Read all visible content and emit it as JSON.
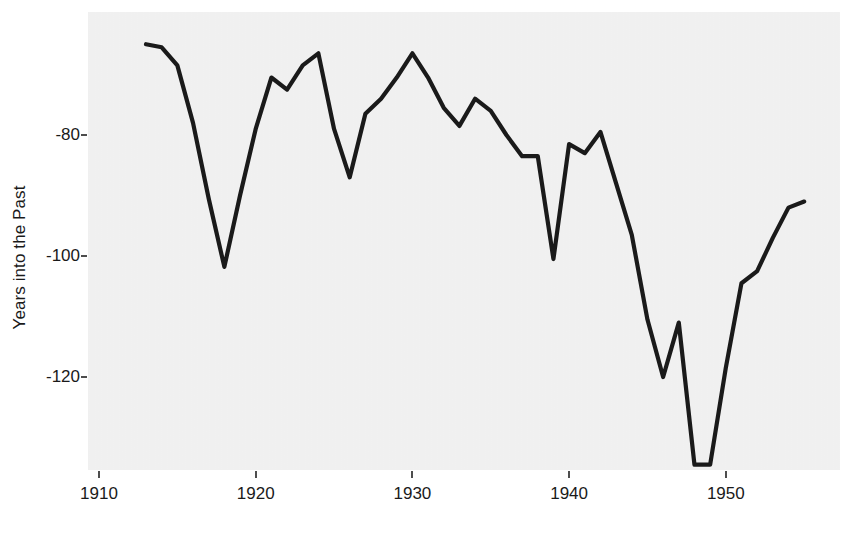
{
  "chart_data": {
    "type": "line",
    "title": "",
    "xlabel": "",
    "ylabel": "Years into the Past",
    "xlim": [
      1912,
      1956
    ],
    "ylim": [
      -137,
      -63
    ],
    "grid": false,
    "legend": null,
    "x_ticks": [
      1910,
      1920,
      1930,
      1940,
      1950
    ],
    "x_tick_labels": [
      "1910",
      "1920",
      "1930",
      "1940",
      "1950"
    ],
    "y_ticks": [
      -80,
      -100,
      -120
    ],
    "y_tick_labels": [
      "-80",
      "-100",
      "-120"
    ],
    "line_color": "#1a1a1a",
    "panel_color": "#f2f2f2",
    "series": [
      {
        "name": "Years into the Past",
        "x": [
          1913,
          1914,
          1915,
          1916,
          1917,
          1918,
          1919,
          1920,
          1921,
          1922,
          1923,
          1924,
          1925,
          1926,
          1927,
          1928,
          1929,
          1930,
          1931,
          1932,
          1933,
          1934,
          1935,
          1936,
          1937,
          1938,
          1939,
          1940,
          1941,
          1942,
          1943,
          1944,
          1945,
          1946,
          1947,
          1948,
          1949,
          1950,
          1951,
          1952,
          1953,
          1954,
          1955
        ],
        "y": [
          -65.0,
          -65.5,
          -68.5,
          -78.0,
          -90.5,
          -101.8,
          -90.0,
          -79.0,
          -70.5,
          -72.5,
          -68.5,
          -66.5,
          -79.0,
          -87.0,
          -76.5,
          -74.0,
          -70.5,
          -66.5,
          -70.5,
          -75.5,
          -78.5,
          -74.0,
          -76.0,
          -80.0,
          -83.5,
          -83.5,
          -100.5,
          -81.5,
          -83.0,
          -79.5,
          -88.0,
          -96.5,
          -110.5,
          -120.0,
          -111.0,
          -134.5,
          -134.5,
          -118.5,
          -104.5,
          -102.5,
          -97.0,
          -92.0,
          -91.0
        ]
      }
    ]
  },
  "axes": {
    "y_title": "Years into the Past"
  }
}
